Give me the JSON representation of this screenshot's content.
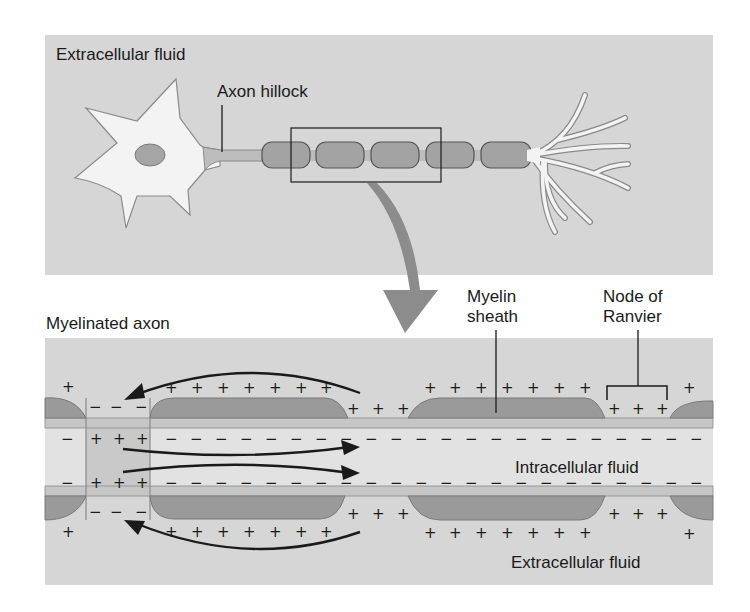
{
  "top_panel": {
    "fluid_label": "Extracellular fluid",
    "axon_hillock_label": "Axon hillock",
    "myelin_segments": 5,
    "terminal_branches": 7
  },
  "bottom_panel": {
    "title": "Myelinated axon",
    "myelin_sheath_label": "Myelin\nsheath",
    "myelin_sheath_line1": "Myelin",
    "myelin_sheath_line2": "sheath",
    "node_label_line1": "Node of",
    "node_label_line2": "Ranvier",
    "intracellular_label": "Intracellular fluid",
    "extracellular_label": "Extracellular fluid",
    "charges": {
      "plus": "+",
      "minus": "−"
    }
  },
  "colors": {
    "panel_bg": "#d6d6d6",
    "myelin": "#9a9a9a",
    "axon": "#bdbdbd",
    "cell_body": "#f2f2f2",
    "arrow": "#8c8c8c",
    "ink": "#1a1a1a"
  }
}
